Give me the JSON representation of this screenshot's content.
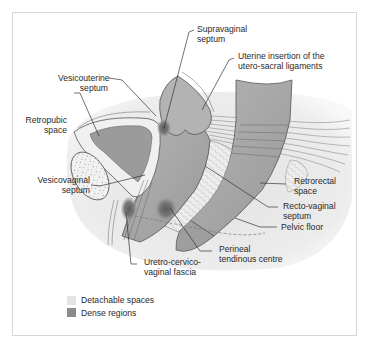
{
  "figure": {
    "labels": [
      {
        "id": "supravaginal-septum",
        "text": "Supravaginal\nseptum"
      },
      {
        "id": "uterine-insertion",
        "text": "Uterine insertion of the\nutero-sacral ligaments"
      },
      {
        "id": "vesicouterine-septum",
        "text": "Vesicouterine\nseptum"
      },
      {
        "id": "retropubic-space",
        "text": "Retropubic\nspace"
      },
      {
        "id": "vesicovaginal-septum",
        "text": "Vesicovaginal\nseptum"
      },
      {
        "id": "retrorectal-space",
        "text": "Retrorectal\nspace"
      },
      {
        "id": "recto-vaginal-septum",
        "text": "Recto-vaginal\nseptum"
      },
      {
        "id": "pelvic-floor",
        "text": "Pelvic floor"
      },
      {
        "id": "perineal-tendinous-centre",
        "text": "Perineal\ntendinous centre"
      },
      {
        "id": "uretro-cervico-vaginal-fascia",
        "text": "Uretro-cervico-\nvaginal fascia"
      }
    ],
    "legend": [
      {
        "label": "Detachable spaces",
        "color": "#e3e3e3"
      },
      {
        "label": "Dense regions",
        "color": "#8a8a8a"
      }
    ],
    "colors": {
      "frame": "#d6d6d6",
      "background_region": "#ececec",
      "organ": "#a8a8a8",
      "organ_dark": "#8f8f8f",
      "dense": "#6e6e6e",
      "line": "#333333"
    }
  }
}
